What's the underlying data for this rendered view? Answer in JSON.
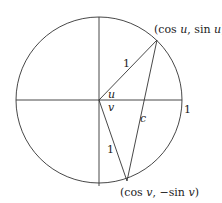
{
  "diagram": {
    "type": "unit-circle-geometry",
    "labels": {
      "point_u": "(cos u, sin u)",
      "point_v": "(cos v, −sin v)",
      "point_u_parts": {
        "open": "(cos ",
        "var1": "u",
        "mid": ", sin ",
        "var2": "u",
        "close": ")"
      },
      "point_v_parts": {
        "open": "(cos ",
        "var1": "v",
        "mid": ", −sin ",
        "var2": "v",
        "close": ")"
      },
      "radius_upper": "1",
      "radius_lower": "1",
      "x_intercept": "1",
      "angle_u": "u",
      "angle_v": "v",
      "chord": "c"
    },
    "colors": {
      "stroke": "#333333",
      "text": "#222222"
    }
  }
}
